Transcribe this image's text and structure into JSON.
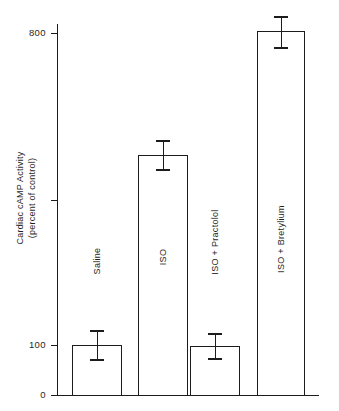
{
  "chart_data": {
    "type": "bar",
    "title": "",
    "xlabel": "",
    "ylabel_line1": "Cardiac cAMP Activity",
    "ylabel_line2": "(percent of control)",
    "categories": [
      "Saline",
      "ISO",
      "ISO + Practolol",
      "ISO + Bretylium"
    ],
    "values": [
      100,
      430,
      98,
      815
    ],
    "errors_upper": [
      25,
      35,
      18,
      42
    ],
    "errors_lower": [
      22,
      32,
      16,
      48
    ],
    "ytick_labels": [
      "800",
      "",
      "100",
      "0"
    ],
    "ytick_values": [
      800,
      450,
      100,
      0
    ],
    "ylim": [
      0,
      860
    ],
    "grid": false,
    "legend": "none",
    "bar_style": "open-outline",
    "axis_break": true
  },
  "axis": {
    "ticks": [
      {
        "label": "800",
        "y": 33
      },
      {
        "label": "",
        "y": 200
      },
      {
        "label": "100",
        "y": 345
      },
      {
        "label": "0",
        "y": 395
      }
    ]
  },
  "bars": [
    {
      "label": "Saline",
      "value": 100,
      "left": 72,
      "right": 122,
      "top": 345,
      "err_top": 330,
      "err_bottom": 359,
      "label_center_y": 262
    },
    {
      "label": "ISO",
      "value": 430,
      "left": 138,
      "right": 188,
      "top": 155,
      "err_top": 140,
      "err_bottom": 169,
      "label_center_y": 258
    },
    {
      "label": "ISO + Practolol",
      "value": 98,
      "left": 190,
      "right": 240,
      "top": 346,
      "err_top": 333,
      "err_bottom": 358,
      "label_center_y": 243
    },
    {
      "label": "ISO + Bretylium",
      "value": 815,
      "left": 257,
      "right": 305,
      "top": 31,
      "err_top": 16,
      "err_bottom": 47,
      "label_center_y": 240
    }
  ],
  "colors": {
    "ink": "#1c1c1c",
    "text": "#1f1f1f",
    "background": "#ffffff"
  }
}
